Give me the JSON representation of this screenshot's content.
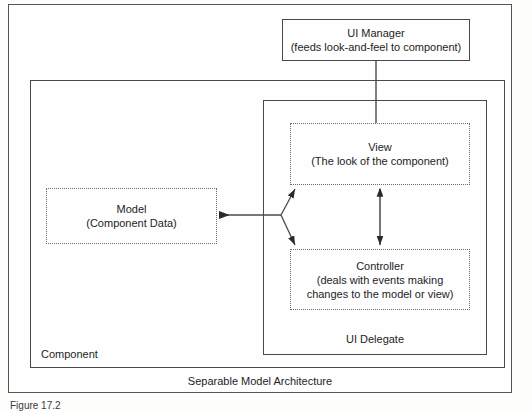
{
  "figure": {
    "architecture_caption": "Separable Model Architecture",
    "figure_number": "Figure 17.2"
  },
  "boxes": {
    "ui_manager": {
      "title": "UI Manager",
      "subtitle": "(feeds look-and-feel to component)",
      "text": "UI Manager\n(feeds look-and-feel to component)"
    },
    "component": {
      "label": "Component"
    },
    "ui_delegate": {
      "label": "UI Delegate"
    },
    "view": {
      "title": "View",
      "subtitle": "(The look of the component)",
      "text": "View\n(The look of the component)"
    },
    "controller": {
      "title": "Controller",
      "subtitle": "(deals with events making changes to the model or view)",
      "text": "Controller\n(deals with events making\nchanges to the model or view)"
    },
    "model": {
      "title": "Model",
      "subtitle": "(Component Data)",
      "text": "Model\n(Component Data)"
    }
  },
  "colors": {
    "line": "#4a4a4a",
    "dotted_line": "#6b6b6b",
    "text": "#1d1d1d",
    "background": "#fefefe"
  }
}
